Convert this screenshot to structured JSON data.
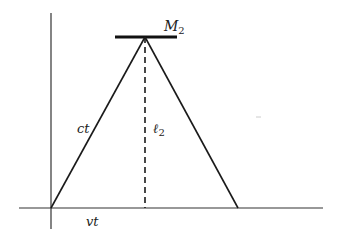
{
  "diagram": {
    "labels": {
      "mirror": "M",
      "mirror_sub": "2",
      "hypotenuse": "ct",
      "height": "ℓ",
      "height_sub": "2",
      "base": "vt"
    },
    "colors": {
      "line": "#1a1a1a",
      "axis": "#333333",
      "background": "#ffffff"
    },
    "geometry": {
      "origin": [
        51,
        208
      ],
      "apex": [
        145,
        37
      ],
      "right_foot": [
        238,
        208
      ],
      "mirror_x": [
        115,
        177
      ],
      "x_axis": [
        19,
        323
      ],
      "y_axis": [
        13,
        229
      ]
    }
  }
}
